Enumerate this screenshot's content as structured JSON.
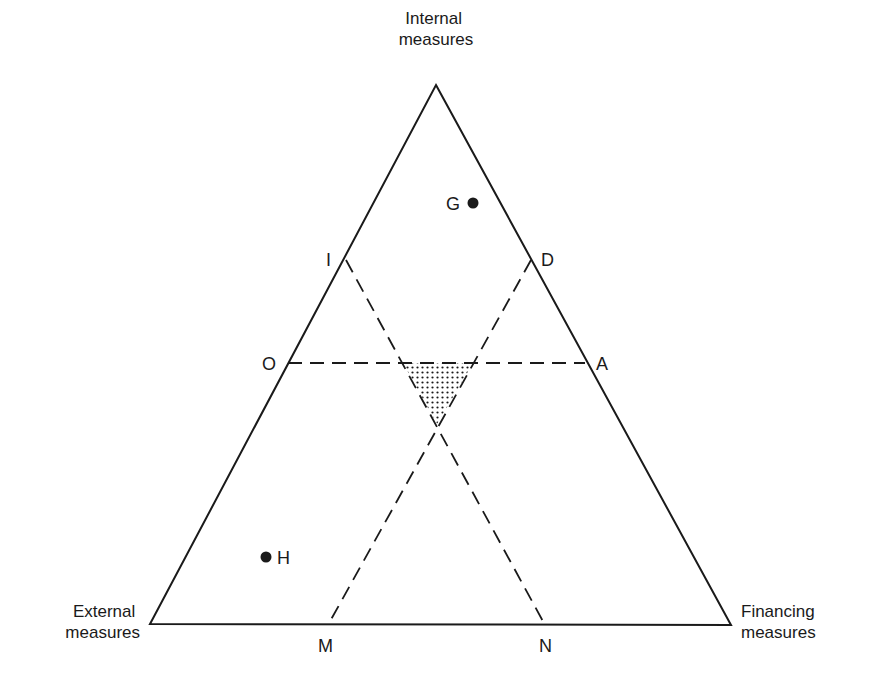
{
  "diagram": {
    "type": "ternary-triangle",
    "vertices": {
      "top": {
        "label_line1": "Internal",
        "label_line2": "measures",
        "x": 436,
        "y": 85
      },
      "left": {
        "label_line1": "External",
        "label_line2": "measures",
        "x": 150,
        "y": 624
      },
      "right": {
        "label_line1": "Financing",
        "label_line2": "measures",
        "x": 731,
        "y": 625
      }
    },
    "edge_points": {
      "I": {
        "label": "I",
        "x": 346,
        "y": 260
      },
      "O": {
        "label": "O",
        "x": 288,
        "y": 363
      },
      "D": {
        "label": "D",
        "x": 531,
        "y": 260
      },
      "A": {
        "label": "A",
        "x": 585,
        "y": 363
      },
      "M": {
        "label": "M",
        "x": 328,
        "y": 625
      },
      "N": {
        "label": "N",
        "x": 545,
        "y": 625
      }
    },
    "dashed_lines": [
      {
        "from": "I",
        "to": "N"
      },
      {
        "from": "D",
        "to": "M"
      },
      {
        "from": "O",
        "to": "A"
      }
    ],
    "shaded_region": {
      "description": "stippled inner triangle",
      "points": [
        [
          403,
          363
        ],
        [
          473,
          363
        ],
        [
          437,
          424
        ]
      ]
    },
    "points": {
      "G": {
        "label": "G",
        "x": 473,
        "y": 203
      },
      "H": {
        "label": "H",
        "x": 266,
        "y": 557
      }
    },
    "colors": {
      "line": "#1a1a1a",
      "background": "#ffffff"
    }
  }
}
